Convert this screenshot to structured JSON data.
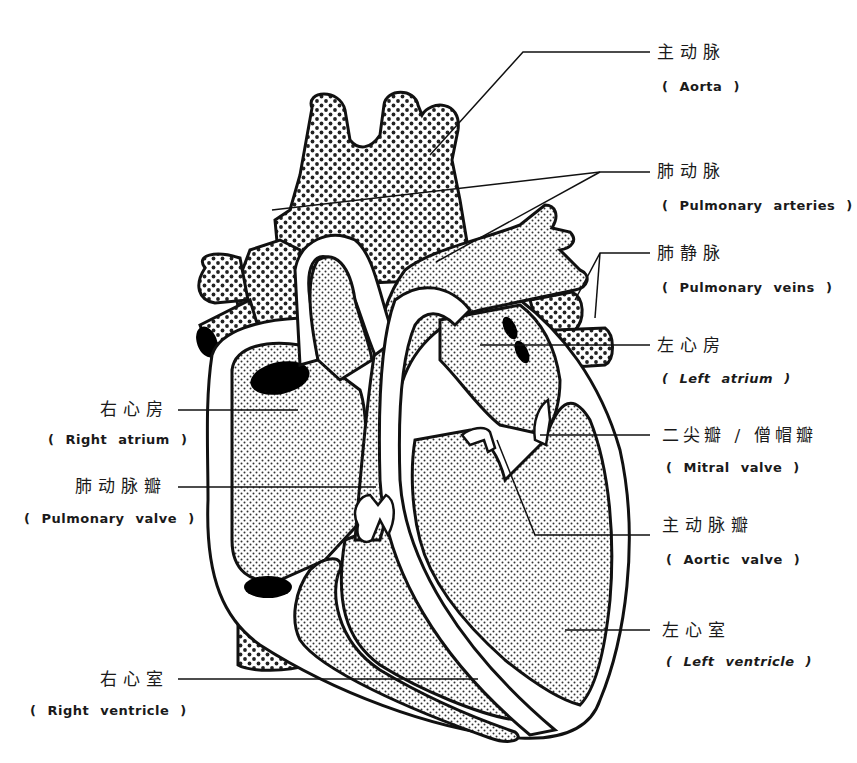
{
  "diagram": {
    "colors": {
      "ink": "#111111",
      "fill_dots": "#222222",
      "background": "#ffffff",
      "chamber_hole": "#000000"
    },
    "labels": {
      "aorta": {
        "zh": "主动脉",
        "en": "( Aorta )"
      },
      "pulmonary_arteries": {
        "zh": "肺动脉",
        "en": "( Pulmonary arteries )"
      },
      "pulmonary_veins": {
        "zh": "肺静脉",
        "en": "( Pulmonary veins )"
      },
      "left_atrium": {
        "zh": "左心房",
        "en": "( Left atrium )"
      },
      "mitral_valve": {
        "zh": "二尖瓣 / 僧帽瓣",
        "en": "( Mitral valve )"
      },
      "aortic_valve": {
        "zh": "主动脉瓣",
        "en": "( Aortic valve )"
      },
      "left_ventricle": {
        "zh": "左心室",
        "en": "( Left ventricle )"
      },
      "right_atrium": {
        "zh": "右心房",
        "en": "( Right atrium )"
      },
      "pulmonary_valve": {
        "zh": "肺动脉瓣",
        "en": "( Pulmonary valve )"
      },
      "right_ventricle": {
        "zh": "右心室",
        "en": "( Right ventricle )"
      }
    }
  }
}
